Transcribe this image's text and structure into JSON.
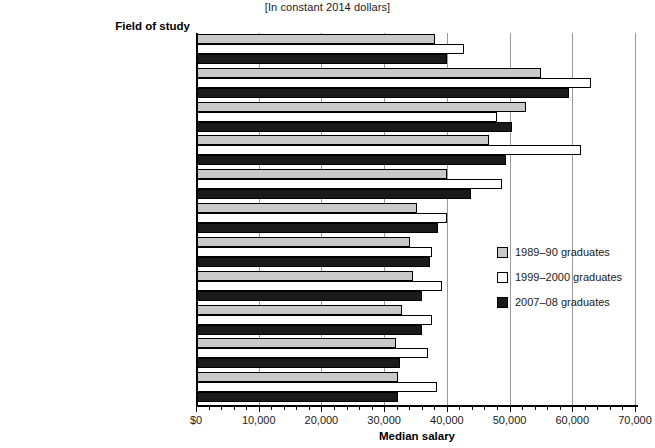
{
  "subtitle": "[In constant 2014 dollars]",
  "column_header": "Field of study",
  "xlabel": "Median salary",
  "legend": [
    {
      "label": "1989–90 graduates",
      "color": "#c9c9c9"
    },
    {
      "label": "1999–2000 graduates",
      "color": "#ffffff"
    },
    {
      "label": "2007–08 graduates",
      "color": "#1a1a1a"
    }
  ],
  "chart_data": {
    "type": "bar",
    "orientation": "horizontal",
    "title": "",
    "subtitle": "[In constant 2014 dollars]",
    "xlabel": "Median salary",
    "ylabel": "Field of study",
    "xlim": [
      0,
      70000
    ],
    "xticks": [
      0,
      10000,
      20000,
      30000,
      40000,
      50000,
      60000,
      70000
    ],
    "xticklabels": [
      "$0",
      "10,000",
      "20,000",
      "30,000",
      "40,000",
      "50,000",
      "60,000",
      "70,000"
    ],
    "minor_ticks_per_interval": 5,
    "grid": true,
    "grid_axis": "x",
    "legend_position": "right-middle",
    "categories": [
      "All fields¹",
      "Engineering",
      "Health professions",
      "Mathematics and computer science²",
      "Business and management",
      "Social sciences and history",
      "Education³",
      "Biological and physical sciences²",
      "Public affairs and social services",
      "Psychology",
      "Humanities"
    ],
    "series": [
      {
        "name": "1989–90 graduates",
        "color": "#c9c9c9",
        "values": [
          37900,
          54800,
          52500,
          46600,
          39800,
          35000,
          33900,
          34400,
          32700,
          31700,
          32000
        ]
      },
      {
        "name": "1999–2000 graduates",
        "color": "#ffffff",
        "values": [
          42600,
          62800,
          47900,
          61200,
          48700,
          39900,
          37400,
          39100,
          37400,
          36800,
          38200
        ]
      },
      {
        "name": "2007–08 graduates",
        "color": "#1a1a1a",
        "values": [
          39800,
          59300,
          50200,
          49300,
          43700,
          38400,
          37100,
          35800,
          35800,
          32300,
          32000
        ]
      }
    ]
  }
}
